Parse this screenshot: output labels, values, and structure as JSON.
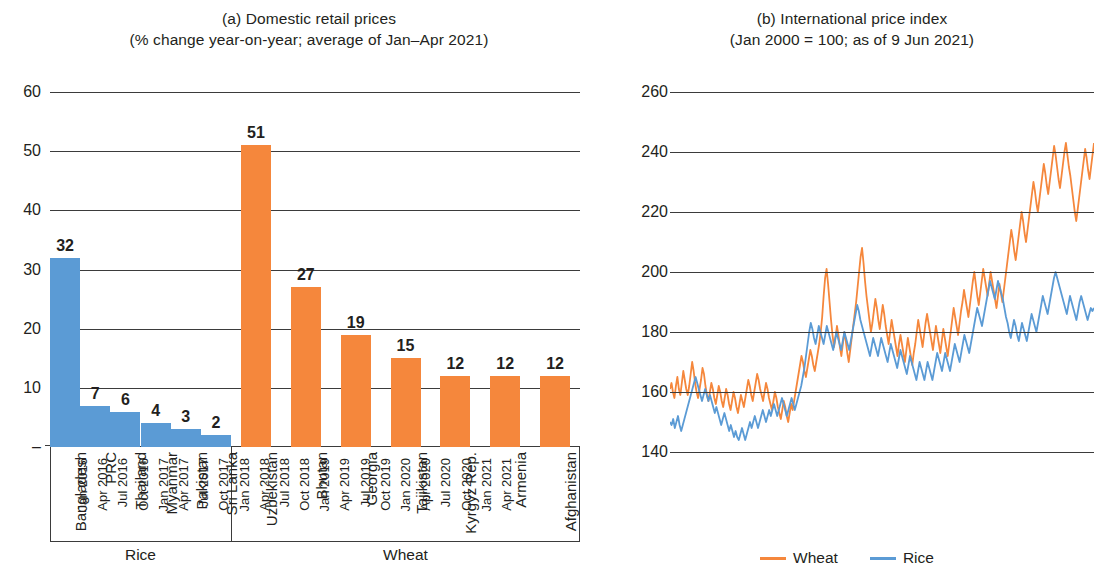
{
  "panel_a": {
    "title_line1": "(a) Domestic retail prices",
    "title_line2": "(% change year-on-year; average of Jan–Apr 2021)",
    "group_rice": "Rice",
    "group_wheat": "Wheat"
  },
  "panel_b": {
    "title_line1": "(b) International price index",
    "title_line2": "(Jan 2000 = 100; as of 9 Jun 2021)",
    "legend": [
      {
        "name": "Wheat",
        "color": "#F5873C"
      },
      {
        "name": "Rice",
        "color": "#5B9BD5"
      }
    ]
  },
  "colors": {
    "rice_blue": "#5B9BD5",
    "wheat_orange": "#F5873C",
    "axis": "#3b3b3b",
    "text": "#231f20"
  },
  "chart_data": [
    {
      "type": "bar",
      "title": "(a) Domestic retail prices",
      "subtitle": "(% change year-on-year; average of Jan–Apr 2021)",
      "xlabel": "",
      "ylabel": "",
      "ylim": [
        0,
        60
      ],
      "yticks": [
        "–",
        "10",
        "20",
        "30",
        "40",
        "50",
        "60"
      ],
      "ytick_values": [
        0,
        10,
        20,
        30,
        40,
        50,
        60
      ],
      "grid": true,
      "legend": "none",
      "groups": [
        {
          "name": "Rice",
          "color": "#5B9BD5",
          "categories": [
            "Bangladesh",
            "PRC",
            "Thailand",
            "Myanmar",
            "Pakistan",
            "Sri Lanka"
          ],
          "values": [
            32,
            7,
            6,
            4,
            3,
            2
          ]
        },
        {
          "name": "Wheat",
          "color": "#F5873C",
          "categories": [
            "Uzbekistan",
            "Bhutan",
            "Georgia",
            "Tajikistan",
            "Kyrgyz Rep.",
            "Armenia",
            "Afghanistan"
          ],
          "values": [
            51,
            27,
            19,
            15,
            12,
            12,
            12
          ]
        }
      ]
    },
    {
      "type": "line",
      "title": "(b) International price index",
      "subtitle": "(Jan 2000 = 100; as of 9 Jun 2021)",
      "xlabel": "",
      "ylabel": "",
      "ylim": [
        140,
        260
      ],
      "yticks": [
        140,
        160,
        180,
        200,
        220,
        240,
        260
      ],
      "grid": true,
      "legend_position": "bottom",
      "x_tick_labels": [
        "Jan 2016",
        "Apr 2016",
        "Jul 2016",
        "Oct 2016",
        "Jan 2017",
        "Apr 2017",
        "Jul 2017",
        "Oct 2017",
        "Jan 2018",
        "Apr 2018",
        "Jul 2018",
        "Oct 2018",
        "Jan 2019",
        "Apr 2019",
        "Jul 2019",
        "Oct 2019",
        "Jan 2020",
        "Apr 2020",
        "Jul 2020",
        "Oct 2020",
        "Jan 2021",
        "Apr 2021"
      ],
      "x_start": "Jan 2016",
      "x_end": "9 Jun 2021",
      "series": [
        {
          "name": "Wheat",
          "color": "#F5873C",
          "values": [
            161,
            163,
            160,
            158,
            162,
            165,
            161,
            159,
            163,
            167,
            164,
            161,
            159,
            162,
            166,
            170,
            167,
            163,
            160,
            158,
            161,
            164,
            168,
            166,
            162,
            159,
            157,
            160,
            163,
            161,
            158,
            156,
            159,
            162,
            160,
            157,
            155,
            158,
            161,
            159,
            156,
            154,
            157,
            160,
            158,
            155,
            153,
            156,
            159,
            157,
            155,
            158,
            161,
            164,
            162,
            159,
            157,
            160,
            163,
            166,
            164,
            161,
            159,
            157,
            160,
            163,
            161,
            158,
            156,
            154,
            157,
            160,
            158,
            155,
            153,
            151,
            154,
            157,
            155,
            152,
            150,
            153,
            156,
            154,
            157,
            160,
            163,
            166,
            169,
            172,
            170,
            167,
            165,
            168,
            171,
            174,
            172,
            169,
            167,
            170,
            173,
            176,
            180,
            185,
            192,
            198,
            201,
            196,
            190,
            184,
            179,
            175,
            178,
            182,
            179,
            175,
            172,
            176,
            180,
            177,
            173,
            170,
            174,
            178,
            182,
            186,
            190,
            195,
            200,
            205,
            208,
            203,
            197,
            192,
            188,
            184,
            180,
            183,
            187,
            191,
            188,
            184,
            181,
            185,
            189,
            186,
            182,
            179,
            176,
            180,
            184,
            181,
            178,
            175,
            172,
            176,
            179,
            176,
            173,
            170,
            174,
            178,
            175,
            172,
            169,
            173,
            176,
            180,
            184,
            181,
            178,
            175,
            179,
            183,
            186,
            183,
            180,
            177,
            174,
            178,
            182,
            179,
            176,
            173,
            177,
            181,
            178,
            175,
            172,
            176,
            180,
            184,
            188,
            185,
            182,
            179,
            183,
            187,
            190,
            194,
            191,
            188,
            185,
            189,
            193,
            197,
            200,
            196,
            192,
            189,
            193,
            197,
            201,
            198,
            195,
            192,
            196,
            200,
            197,
            194,
            191,
            188,
            192,
            196,
            193,
            190,
            194,
            198,
            202,
            206,
            210,
            214,
            211,
            207,
            204,
            208,
            212,
            216,
            220,
            217,
            213,
            210,
            214,
            218,
            222,
            226,
            230,
            227,
            223,
            220,
            224,
            228,
            232,
            236,
            233,
            229,
            226,
            230,
            234,
            238,
            242,
            239,
            235,
            231,
            228,
            232,
            236,
            240,
            243,
            239,
            235,
            232,
            228,
            224,
            220,
            217,
            221,
            225,
            229,
            233,
            237,
            241,
            238,
            234,
            231,
            235,
            239,
            243
          ]
        },
        {
          "name": "Rice",
          "color": "#5B9BD5",
          "values": [
            150,
            149,
            151,
            148,
            150,
            152,
            149,
            147,
            149,
            151,
            153,
            155,
            157,
            159,
            161,
            163,
            165,
            163,
            161,
            159,
            157,
            159,
            161,
            159,
            157,
            159,
            157,
            155,
            153,
            155,
            153,
            151,
            149,
            151,
            153,
            151,
            149,
            147,
            149,
            147,
            145,
            147,
            145,
            144,
            146,
            148,
            146,
            144,
            146,
            148,
            150,
            148,
            150,
            152,
            150,
            148,
            150,
            152,
            154,
            152,
            150,
            152,
            154,
            152,
            154,
            156,
            154,
            152,
            154,
            156,
            158,
            156,
            154,
            152,
            154,
            156,
            158,
            156,
            154,
            156,
            158,
            160,
            162,
            165,
            168,
            172,
            176,
            180,
            183,
            181,
            178,
            176,
            179,
            182,
            180,
            178,
            176,
            179,
            182,
            180,
            178,
            176,
            174,
            177,
            180,
            178,
            176,
            174,
            177,
            180,
            178,
            176,
            174,
            177,
            180,
            183,
            186,
            189,
            187,
            184,
            182,
            180,
            178,
            176,
            174,
            172,
            175,
            178,
            176,
            174,
            172,
            175,
            178,
            176,
            174,
            172,
            170,
            173,
            176,
            174,
            172,
            170,
            168,
            171,
            174,
            172,
            170,
            168,
            166,
            169,
            172,
            170,
            168,
            166,
            164,
            167,
            170,
            168,
            166,
            164,
            167,
            170,
            168,
            166,
            164,
            167,
            170,
            173,
            171,
            169,
            167,
            170,
            173,
            171,
            169,
            167,
            170,
            173,
            176,
            174,
            172,
            170,
            173,
            176,
            179,
            177,
            175,
            173,
            176,
            179,
            182,
            185,
            188,
            186,
            184,
            182,
            185,
            188,
            191,
            194,
            197,
            195,
            193,
            191,
            194,
            197,
            195,
            193,
            191,
            188,
            185,
            183,
            180,
            178,
            181,
            184,
            182,
            179,
            177,
            180,
            183,
            181,
            179,
            177,
            180,
            183,
            186,
            184,
            182,
            180,
            183,
            186,
            189,
            192,
            190,
            188,
            186,
            189,
            192,
            195,
            198,
            200,
            198,
            196,
            194,
            192,
            190,
            188,
            186,
            189,
            192,
            190,
            188,
            186,
            184,
            187,
            190,
            192,
            190,
            188,
            186,
            184,
            186,
            188,
            187,
            188
          ]
        }
      ]
    }
  ]
}
